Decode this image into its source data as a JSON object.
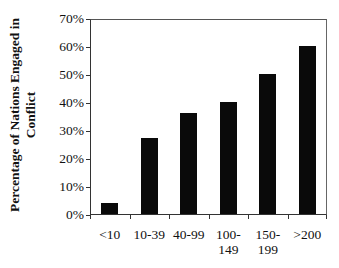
{
  "chart_data": {
    "type": "bar",
    "title": "",
    "xlabel": "",
    "ylabel": "Percentage of Nations Engaged in Conflict",
    "ylim": [
      0,
      70
    ],
    "yticks": [
      "0%",
      "10%",
      "20%",
      "30%",
      "40%",
      "50%",
      "60%",
      "70%"
    ],
    "categories": [
      "<10",
      "10-39",
      "40-99",
      "100-149",
      "150-199",
      ">200"
    ],
    "category_labels": [
      [
        "<10"
      ],
      [
        "10-39"
      ],
      [
        "40-99"
      ],
      [
        "100-",
        "149"
      ],
      [
        "150-",
        "199"
      ],
      [
        ">200"
      ]
    ],
    "values": [
      4,
      27,
      36,
      40,
      50,
      60
    ],
    "grid": false,
    "legend": null,
    "bar_color": "#0a0a0a"
  },
  "labels": {
    "ylabel_line1": "Percentage of Nations Engaged in",
    "ylabel_line2": "Conflict"
  }
}
